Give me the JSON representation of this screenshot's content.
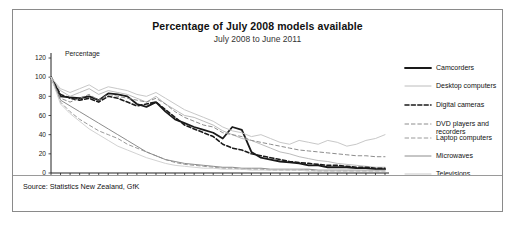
{
  "chart_data": {
    "type": "line",
    "title": "Percentage of July 2008 models available",
    "subtitle": "July 2008 to June 2011",
    "ylabel": "Percentage",
    "xlabel": "",
    "ylim": [
      0,
      120
    ],
    "yticks": [
      0,
      20,
      40,
      60,
      80,
      100,
      120
    ],
    "grid": false,
    "legend_position": "right",
    "source": "Source: Statistics New Zealand, GfK",
    "x": [
      "J",
      "A",
      "S",
      "O",
      "N",
      "D",
      "J",
      "F",
      "M",
      "A",
      "M",
      "J",
      "J",
      "A",
      "S",
      "O",
      "N",
      "D",
      "J",
      "F",
      "M",
      "A",
      "M",
      "J",
      "J",
      "A",
      "S",
      "O",
      "N",
      "D",
      "J",
      "F",
      "M",
      "A",
      "M",
      "J"
    ],
    "year_labels": [
      {
        "label": "08",
        "index": 0
      },
      {
        "label": "09",
        "index": 6
      },
      {
        "label": "10",
        "index": 18
      },
      {
        "label": "11",
        "index": 30
      }
    ],
    "series": [
      {
        "name": "Camcorders",
        "style": "solid",
        "color": "#1a1a1a",
        "width": 1.8,
        "values": [
          100,
          80,
          79,
          78,
          80,
          76,
          83,
          82,
          80,
          72,
          69,
          74,
          64,
          56,
          52,
          48,
          45,
          42,
          36,
          48,
          45,
          22,
          16,
          14,
          12,
          11,
          10,
          8,
          8,
          6,
          6,
          6,
          5,
          5,
          4,
          4
        ]
      },
      {
        "name": "Desktop computers",
        "style": "solid",
        "color": "#b4b4b4",
        "width": 0.9,
        "values": [
          100,
          86,
          80,
          84,
          88,
          82,
          86,
          84,
          82,
          78,
          74,
          80,
          72,
          66,
          60,
          58,
          54,
          50,
          44,
          40,
          36,
          34,
          30,
          26,
          22,
          20,
          17,
          15,
          13,
          12,
          10,
          9,
          8,
          7,
          6,
          6
        ]
      },
      {
        "name": "Digital cameras",
        "style": "dash-bold",
        "color": "#1a1a1a",
        "width": 1.6,
        "values": [
          100,
          82,
          78,
          76,
          78,
          74,
          80,
          78,
          74,
          70,
          72,
          74,
          66,
          58,
          50,
          46,
          42,
          38,
          30,
          26,
          24,
          20,
          18,
          16,
          14,
          12,
          11,
          10,
          9,
          8,
          8,
          7,
          6,
          6,
          5,
          5
        ]
      },
      {
        "name": "DVD players and recorders",
        "style": "dash",
        "color": "#8c8c8c",
        "width": 1.0,
        "values": [
          100,
          78,
          74,
          78,
          82,
          76,
          82,
          80,
          78,
          76,
          74,
          78,
          72,
          64,
          58,
          54,
          50,
          48,
          42,
          40,
          38,
          34,
          32,
          30,
          28,
          26,
          24,
          23,
          22,
          21,
          20,
          19,
          18,
          18,
          17,
          17
        ]
      },
      {
        "name": "Laptop computers",
        "style": "dash",
        "color": "#9a9a9a",
        "width": 1.0,
        "values": [
          100,
          74,
          64,
          56,
          50,
          44,
          40,
          36,
          30,
          26,
          22,
          18,
          14,
          11,
          9,
          8,
          7,
          6,
          5,
          5,
          4,
          4,
          4,
          3,
          3,
          3,
          3,
          3,
          2,
          2,
          2,
          2,
          2,
          2,
          2,
          2
        ]
      },
      {
        "name": "Microwaves",
        "style": "solid",
        "color": "#8c8c8c",
        "width": 1.0,
        "values": [
          100,
          76,
          70,
          64,
          58,
          52,
          46,
          40,
          34,
          28,
          22,
          18,
          14,
          12,
          10,
          9,
          8,
          7,
          6,
          6,
          5,
          5,
          5,
          4,
          4,
          4,
          4,
          4,
          3,
          3,
          3,
          3,
          3,
          3,
          3,
          3
        ]
      },
      {
        "name": "Televisions",
        "style": "solid",
        "color": "#c8c8c8",
        "width": 1.0,
        "values": [
          100,
          88,
          84,
          88,
          92,
          86,
          90,
          88,
          86,
          82,
          80,
          84,
          78,
          72,
          66,
          62,
          58,
          54,
          48,
          44,
          42,
          38,
          40,
          36,
          32,
          30,
          34,
          32,
          30,
          34,
          32,
          28,
          30,
          34,
          36,
          40
        ]
      },
      {
        "name": "Portable media players",
        "style": "solid",
        "color": "#d2d2d2",
        "width": 1.0,
        "values": [
          100,
          72,
          62,
          54,
          46,
          40,
          34,
          28,
          24,
          20,
          16,
          13,
          10,
          8,
          7,
          6,
          5,
          5,
          4,
          4,
          4,
          3,
          3,
          3,
          3,
          3,
          3,
          2,
          2,
          2,
          2,
          2,
          2,
          2,
          2,
          2
        ]
      }
    ]
  },
  "legend": {
    "items": [
      {
        "label": "Camcorders"
      },
      {
        "label": "Desktop computers"
      },
      {
        "label": "Digital cameras"
      },
      {
        "label": "DVD players and"
      },
      {
        "label": "recorders"
      },
      {
        "label": "Laptop computers"
      },
      {
        "label": "Microwaves"
      },
      {
        "label": "Televisions"
      },
      {
        "label": "Portable media players"
      }
    ]
  }
}
